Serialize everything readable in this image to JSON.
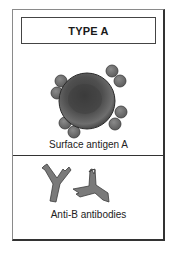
{
  "figure": {
    "title": "TYPE A",
    "antigen_label": "Surface antigen A",
    "antibody_label": "Anti-B antibodies"
  },
  "icons": {
    "cell": "red-blood-cell-icon",
    "antigen": "surface-antigen-icon",
    "antibody": "y-shaped-antibody-icon"
  },
  "colors": {
    "cell_fill": "#555555",
    "cell_edge": "#2a2a2a",
    "antigen_fill": "#6b6b6b",
    "antibody_fill": "#7a7a7a",
    "line": "#333333"
  }
}
